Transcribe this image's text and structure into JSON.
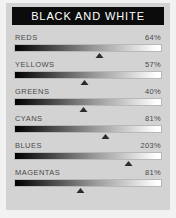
{
  "panel": {
    "header_title": "BLACK AND WHITE",
    "header_bg": "#0c0c0c",
    "header_text_color": "#ffffff",
    "panel_bg": "#d3d3d3",
    "background": "#f2f2f2",
    "label_color": "#4a4a4a",
    "track_start_color": "#000000",
    "track_end_color": "#ffffff",
    "marker_color": "#2b2b2b"
  },
  "sliders": [
    {
      "label": "REDS",
      "value": "64%",
      "percent": 64,
      "marker_pos": 58
    },
    {
      "label": "YELLOWS",
      "value": "57%",
      "percent": 57,
      "marker_pos": 48
    },
    {
      "label": "GREENS",
      "value": "40%",
      "percent": 40,
      "marker_pos": 47
    },
    {
      "label": "CYANS",
      "value": "81%",
      "percent": 81,
      "marker_pos": 62
    },
    {
      "label": "BLUES",
      "value": "203%",
      "percent": 203,
      "marker_pos": 78
    },
    {
      "label": "MAGENTAS",
      "value": "81%",
      "percent": 81,
      "marker_pos": 45
    }
  ]
}
